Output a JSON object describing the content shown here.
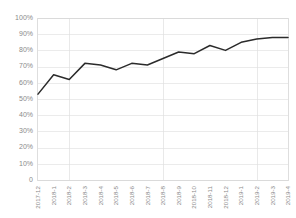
{
  "chart_data": {
    "type": "line",
    "title": "",
    "xlabel": "",
    "ylabel": "",
    "ylim": [
      0,
      100
    ],
    "yticks": [
      0,
      10,
      20,
      30,
      40,
      50,
      60,
      70,
      80,
      90,
      100
    ],
    "ytick_labels": [
      "0",
      "10%",
      "20%",
      "30%",
      "40%",
      "50%",
      "60%",
      "70%",
      "80%",
      "90%",
      "100%"
    ],
    "grid": true,
    "legend": false,
    "legend_position": "none",
    "line_color": "#2b2b2b",
    "grid_color": "#e3e3e3",
    "tick_label_color": "#8a8a8a",
    "categories": [
      "2017-12",
      "2018-1",
      "2018-2",
      "2018-3",
      "2018-4",
      "2018-5",
      "2018-6",
      "2018-7",
      "2018-8",
      "2018-9",
      "2018-10",
      "2018-11",
      "2018-12",
      "2019-1",
      "2019-2",
      "2019-3",
      "2019-4"
    ],
    "values": [
      53,
      65,
      62,
      72,
      71,
      68,
      72,
      71,
      75,
      79,
      78,
      83,
      80,
      85,
      87,
      88,
      88
    ]
  }
}
